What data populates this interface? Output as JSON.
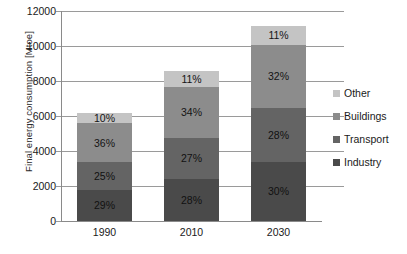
{
  "chart_data": {
    "type": "bar",
    "stacked": true,
    "title": "",
    "subtitle": "",
    "xlabel": "",
    "ylabel": "Final energy consumption [Mtoe]",
    "categories": [
      "1990",
      "2010",
      "2030"
    ],
    "ylim": [
      0,
      12000
    ],
    "y_ticks": [
      0,
      2000,
      4000,
      6000,
      8000,
      10000,
      12000
    ],
    "y_tick_labels": [
      "0",
      "2000",
      "4000",
      "6000",
      "8000",
      "10000",
      "12000"
    ],
    "grid": true,
    "grid_axis": "y",
    "legend_position": "right",
    "totals": [
      6200,
      8600,
      11150
    ],
    "series": [
      {
        "name": "Industry",
        "color": "#4a4a4a",
        "values": [
          1798,
          2408,
          3345
        ],
        "percent_labels": [
          "29%",
          "28%",
          "30%"
        ]
      },
      {
        "name": "Transport",
        "color": "#646464",
        "values": [
          1550,
          2322,
          3122
        ],
        "percent_labels": [
          "25%",
          "27%",
          "28%"
        ]
      },
      {
        "name": "Buildings",
        "color": "#8c8c8c",
        "values": [
          2232,
          2924,
          3568
        ],
        "percent_labels": [
          "36%",
          "34%",
          "32%"
        ]
      },
      {
        "name": "Other",
        "color": "#c4c4c4",
        "values": [
          620,
          946,
          1115
        ],
        "percent_labels": [
          "10%",
          "11%",
          "11%"
        ]
      }
    ],
    "legend_entries": [
      {
        "label": "Other",
        "color": "#c4c4c4"
      },
      {
        "label": "Buildings",
        "color": "#8c8c8c"
      },
      {
        "label": "Transport",
        "color": "#646464"
      },
      {
        "label": "Industry",
        "color": "#4a4a4a"
      }
    ]
  }
}
